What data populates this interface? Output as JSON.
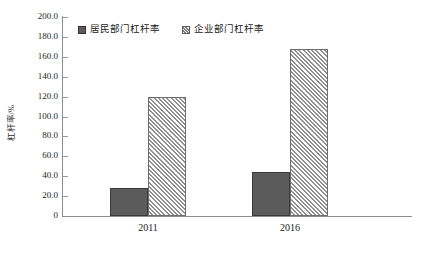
{
  "chart_data": {
    "type": "bar",
    "title": "",
    "subtitle": "",
    "xlabel": "",
    "ylabel": "杠杆率/%",
    "categories": [
      "2011",
      "2016"
    ],
    "series": [
      {
        "name": "居民部门杠杆率",
        "values": [
          28.0,
          44.0
        ],
        "style": "solid",
        "color": "#5b5b5b"
      },
      {
        "name": "企业部门杠杆率",
        "values": [
          120.0,
          168.0
        ],
        "style": "hatched",
        "color": "#8f8f8f"
      }
    ],
    "ylim": [
      0,
      200
    ],
    "ytick_values": [
      200.0,
      180.0,
      160.0,
      140.0,
      120.0,
      100.0,
      80.0,
      60.0,
      40.0,
      20.0,
      0
    ],
    "ytick_labels": [
      "200.0",
      "180.0",
      "160.0",
      "140.0",
      "120.0",
      "100.0",
      "80.0",
      "60.0",
      "40.0",
      "20.0",
      "0"
    ],
    "grid": false,
    "legend_position": "top-center"
  },
  "axis": {
    "y_title": "杠杆率/%",
    "ticks": [
      {
        "label": "200.0",
        "value": 200
      },
      {
        "label": "180.0",
        "value": 180
      },
      {
        "label": "160.0",
        "value": 160
      },
      {
        "label": "140.0",
        "value": 140
      },
      {
        "label": "120.0",
        "value": 120
      },
      {
        "label": "100.0",
        "value": 100
      },
      {
        "label": "80.0",
        "value": 80
      },
      {
        "label": "60.0",
        "value": 60
      },
      {
        "label": "40.0",
        "value": 40
      },
      {
        "label": "20.0",
        "value": 20
      },
      {
        "label": "0",
        "value": 0
      }
    ]
  },
  "categories": [
    {
      "label": "2011"
    },
    {
      "label": "2016"
    }
  ],
  "legend": {
    "items": [
      {
        "label": "居民部门杠杆率",
        "style": "solid"
      },
      {
        "label": "企业部门杠杆率",
        "style": "hatched"
      }
    ]
  },
  "caption": {
    "text": ""
  },
  "colors": {
    "solid_fill": "#5b5b5b",
    "hatch_line": "#8f8f8f",
    "axis": "#8d8d8d",
    "text": "#1b1b1b"
  }
}
